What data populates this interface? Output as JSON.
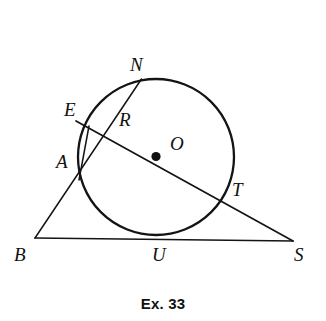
{
  "figure": {
    "caption": "Ex. 33",
    "type": "euclidean-geometry-diagram",
    "stroke_color": "#141414",
    "background_color": "#ffffff",
    "circle": {
      "center_label": "O",
      "center_x": 156,
      "center_y": 157,
      "radius": 78
    },
    "points": [
      {
        "label": "N",
        "x": 140,
        "y": 82,
        "label_x": 130,
        "label_y": 55,
        "on_circle": true
      },
      {
        "label": "E",
        "x": 88,
        "y": 127,
        "label_x": 64,
        "label_y": 100,
        "on_circle": true
      },
      {
        "label": "R",
        "x": 107,
        "y": 139,
        "label_x": 119,
        "label_y": 110,
        "on_circle": false
      },
      {
        "label": "A",
        "x": 82,
        "y": 173,
        "label_x": 56,
        "label_y": 152,
        "on_circle": true
      },
      {
        "label": "O",
        "x": 156,
        "y": 157,
        "label_x": 170,
        "label_y": 134,
        "on_circle": false
      },
      {
        "label": "T",
        "x": 222,
        "y": 198,
        "label_x": 232,
        "label_y": 180,
        "on_circle": true
      },
      {
        "label": "B",
        "x": 35,
        "y": 238,
        "label_x": 14,
        "label_y": 245,
        "on_circle": false
      },
      {
        "label": "U",
        "x": 157,
        "y": 236,
        "label_x": 152,
        "label_y": 245,
        "on_circle": true
      },
      {
        "label": "S",
        "x": 293,
        "y": 241,
        "label_x": 294,
        "label_y": 245,
        "on_circle": false
      }
    ],
    "segments": [
      {
        "name": "secant-E-O-T-S",
        "from": "E",
        "to": "S",
        "x1": 84,
        "y1": 125,
        "x2": 293,
        "y2": 241
      },
      {
        "name": "secant-B-A-R-N",
        "from": "B",
        "to": "N",
        "x1": 35,
        "y1": 238,
        "x2": 141,
        "y2": 80
      },
      {
        "name": "chord-E-A",
        "from": "E",
        "to": "A",
        "x1": 88,
        "y1": 127,
        "x2": 82,
        "y2": 173
      },
      {
        "name": "tangent-B-U-S",
        "from": "B",
        "to": "S",
        "x1": 35,
        "y1": 238,
        "x2": 293,
        "y2": 241
      }
    ]
  }
}
